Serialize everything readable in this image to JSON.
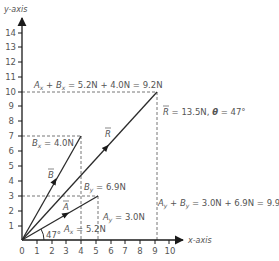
{
  "diagram": {
    "type": "vector-addition",
    "axes": {
      "x_label": "x-axis",
      "y_label": "y-axis",
      "x_ticks": [
        "0",
        "1",
        "2",
        "3",
        "4",
        "5",
        "6",
        "7",
        "8",
        "9",
        "10"
      ],
      "y_ticks": [
        "1",
        "2",
        "3",
        "4",
        "5",
        "6",
        "7",
        "8",
        "9",
        "10",
        "11",
        "12",
        "13",
        "14"
      ]
    },
    "vectors": {
      "A": {
        "label": "A",
        "x": 5.2,
        "y": 3.0
      },
      "B": {
        "label": "B",
        "x": 4.0,
        "y": 6.9
      },
      "R": {
        "label": "R",
        "x": 9.2,
        "y": 9.9
      }
    },
    "annotations": {
      "sum_x": "Aₓ + Bₓ = 5.2N + 4.0N = 9.2N",
      "sum_x_parts": {
        "a": "A",
        "a_sub": "x",
        "plus": " + ",
        "b": "B",
        "b_sub": "x",
        "rest": " = 5.2N + 4.0N = 9.2N"
      },
      "sum_y_parts": {
        "a": "A",
        "a_sub": "y",
        "plus": " + ",
        "b": "B",
        "b_sub": "y",
        "rest": " = 3.0N + 6.9N = 9.9N"
      },
      "resultant_parts": {
        "r": "R",
        "rest": " = 13.5N, ",
        "theta": "θ",
        "rest2": " = 47°"
      },
      "bx_parts": {
        "v": "B",
        "sub": "x",
        "rest": " = 4.0N"
      },
      "by_parts": {
        "v": "B",
        "sub": "y",
        "rest": " = 6.9N"
      },
      "ax_parts": {
        "v": "A",
        "sub": "x",
        "rest": " = 5.2N"
      },
      "ay_parts": {
        "v": "A",
        "sub": "y",
        "rest": " = 3.0N"
      },
      "angle": "47°"
    },
    "colors": {
      "line": "#2b2b2b",
      "dashed": "#777777",
      "text": "#555555"
    }
  }
}
